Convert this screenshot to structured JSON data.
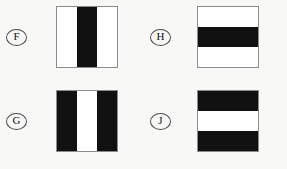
{
  "figure": {
    "kind": "multiple-choice-answer-options",
    "background_color": "#f8f8f7",
    "swatch_border_color": "#8c8c8c",
    "black_color": "#111111",
    "white_color": "#ffffff",
    "options": [
      {
        "id": "f",
        "label": "F",
        "orientation": "vertical",
        "bands": [
          "white",
          "black",
          "white"
        ],
        "description": "white square with a central vertical black bar"
      },
      {
        "id": "g",
        "label": "G",
        "orientation": "vertical",
        "bands": [
          "black",
          "white",
          "black"
        ],
        "description": "black square with a central vertical white bar"
      },
      {
        "id": "h",
        "label": "H",
        "orientation": "horizontal",
        "bands": [
          "white",
          "black",
          "white"
        ],
        "description": "white square with a central horizontal black bar"
      },
      {
        "id": "j",
        "label": "J",
        "orientation": "horizontal",
        "bands": [
          "black",
          "white",
          "black"
        ],
        "description": "black square with a central horizontal white bar"
      }
    ]
  }
}
